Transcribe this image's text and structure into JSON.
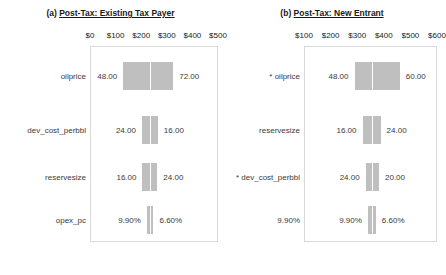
{
  "figure": {
    "width": 443,
    "height": 275,
    "bar_color": "#bfbfbf",
    "plot_border_color": "#d9d9d9",
    "text_color": "#3a3a3a"
  },
  "chart_data": [
    {
      "type": "bar",
      "subtype": "tornado",
      "panel_id": "a",
      "panel_number": "(a)",
      "title": "Post-Tax: Existing Tax Payer",
      "title_full": "(a) Post-Tax: Existing Tax Payer",
      "xlabel": "",
      "ylabel": "",
      "xlim": [
        0,
        500
      ],
      "xticks": [
        0,
        100,
        200,
        300,
        400,
        500
      ],
      "xticklabels": [
        "$0",
        "$100",
        "$200",
        "$300",
        "$400",
        "$500"
      ],
      "grid": false,
      "legend": "none",
      "base_value": 235,
      "categories": [
        "oilprice",
        "dev_cost_perbbl",
        "reservesize",
        "opex_pc"
      ],
      "bars": [
        {
          "category": "oilprice",
          "label": "oilprice",
          "low_label": "48.00",
          "high_label": "72.00",
          "low_x": 130,
          "high_x": 325
        },
        {
          "category": "dev_cost_perbbl",
          "label": "dev_cost_perbbl",
          "low_label": "24.00",
          "high_label": "16.00",
          "low_x": 203,
          "high_x": 265
        },
        {
          "category": "reservesize",
          "label": "reservesize",
          "low_label": "16.00",
          "high_label": "24.00",
          "low_x": 205,
          "high_x": 263
        },
        {
          "category": "opex_pc",
          "label": "opex_pc",
          "low_label": "9.90%",
          "high_label": "6.60%",
          "low_x": 222,
          "high_x": 248
        }
      ]
    },
    {
      "type": "bar",
      "subtype": "tornado",
      "panel_id": "b",
      "panel_number": "(b)",
      "title": "Post-Tax: New Entrant",
      "title_full": "(b) Post-Tax: New Entrant",
      "xlabel": "",
      "ylabel": "",
      "xlim": [
        100,
        600
      ],
      "xticks": [
        100,
        200,
        300,
        400,
        500,
        600
      ],
      "xticklabels": [
        "$100",
        "$200",
        "$300",
        "$400",
        "$500",
        "$600"
      ],
      "grid": false,
      "legend": "none",
      "base_value": 355,
      "categories": [
        "* oilprice",
        "reservesize",
        "* dev_cost_perbbl",
        "opex_pc"
      ],
      "bars": [
        {
          "category": "oilprice",
          "label": "* oilprice",
          "low_label": "48.00",
          "high_label": "60.00",
          "low_x": 290,
          "high_x": 460
        },
        {
          "category": "reservesize",
          "label": "reservesize",
          "low_label": "16.00",
          "high_label": "24.00",
          "low_x": 320,
          "high_x": 388
        },
        {
          "category": "dev_cost_perbbl",
          "label": "* dev_cost_perbbl",
          "low_label": "24.00",
          "high_label": "20.00",
          "low_x": 332,
          "high_x": 382
        },
        {
          "category": "opex_pc",
          "label": "9.90%",
          "low_label": "9.90%",
          "high_label": "6.60%",
          "low_x": 340,
          "high_x": 370
        }
      ]
    }
  ],
  "panel_a": {
    "title_number": "(a)",
    "title_text": "Post-Tax: Existing Tax Payer",
    "ticks": [
      "$0",
      "$100",
      "$200",
      "$300",
      "$400",
      "$500"
    ],
    "rows": [
      {
        "label": "oilprice",
        "low": "48.00",
        "high": "72.00"
      },
      {
        "label": "dev_cost_perbbl",
        "low": "24.00",
        "high": "16.00"
      },
      {
        "label": "reservesize",
        "low": "16.00",
        "high": "24.00"
      },
      {
        "label": "opex_pc",
        "low": "9.90%",
        "high": "6.60%"
      }
    ]
  },
  "panel_b": {
    "title_number": "(b)",
    "title_text": "Post-Tax: New Entrant",
    "ticks": [
      "$100",
      "$200",
      "$300",
      "$400",
      "$500",
      "$600"
    ],
    "rows": [
      {
        "label": "* oilprice",
        "low": "48.00",
        "high": "60.00"
      },
      {
        "label": "reservesize",
        "low": "16.00",
        "high": "24.00"
      },
      {
        "label": "* dev_cost_perbbl",
        "low": "24.00",
        "high": "20.00"
      },
      {
        "label": "opex_pc",
        "low": "9.90%",
        "high": "6.60%"
      }
    ]
  }
}
